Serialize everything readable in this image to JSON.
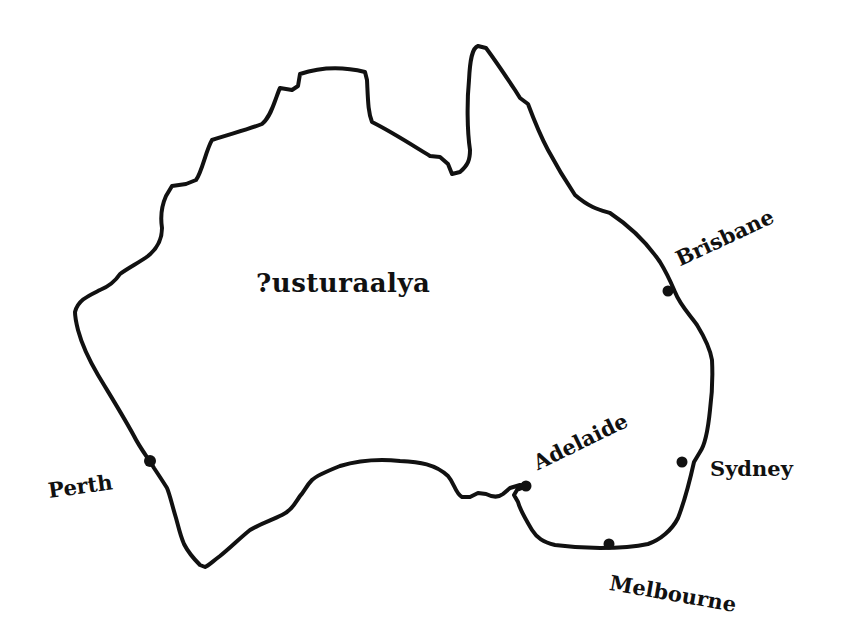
{
  "map": {
    "country_label": "?usturaalya",
    "outline_color": "#111111",
    "background": "#ffffff",
    "cities": [
      {
        "name": "Brisbane",
        "dot": [
          668,
          291
        ]
      },
      {
        "name": "Perth",
        "dot": [
          150,
          462
        ]
      },
      {
        "name": "Adelaide",
        "dot": [
          525,
          486
        ]
      },
      {
        "name": "Sydney",
        "dot": [
          682,
          462
        ]
      },
      {
        "name": "Melbourne",
        "dot": [
          609,
          545
        ]
      }
    ]
  }
}
